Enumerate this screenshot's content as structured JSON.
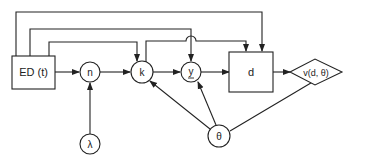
{
  "diagram": {
    "stroke_color": "#222222",
    "background": "#ffffff",
    "nodes": {
      "ed": {
        "label": "ED (t)",
        "shape": "rect"
      },
      "n": {
        "label": "n",
        "shape": "circle"
      },
      "k": {
        "label": "k",
        "shape": "circle"
      },
      "y": {
        "label": "y",
        "shape": "circle",
        "underlined": true
      },
      "d": {
        "label": "d",
        "shape": "rect"
      },
      "v": {
        "label": "v(d, θ)",
        "shape": "diamond"
      },
      "lambda": {
        "label": "λ",
        "shape": "circle"
      },
      "theta": {
        "label": "θ",
        "shape": "circle"
      }
    },
    "edges": [
      {
        "from": "ED (t)",
        "to": "n"
      },
      {
        "from": "n",
        "to": "k"
      },
      {
        "from": "k",
        "to": "y"
      },
      {
        "from": "y",
        "to": "d"
      },
      {
        "from": "d",
        "to": "v(d, θ)"
      },
      {
        "from": "λ",
        "to": "n"
      },
      {
        "from": "θ",
        "to": "k"
      },
      {
        "from": "θ",
        "to": "y"
      },
      {
        "from": "θ",
        "to": "v(d, θ)"
      },
      {
        "from": "ED (t)",
        "to": "k"
      },
      {
        "from": "ED (t)",
        "to": "y"
      },
      {
        "from": "ED (t)",
        "to": "d"
      },
      {
        "from": "k",
        "to": "d"
      }
    ]
  }
}
